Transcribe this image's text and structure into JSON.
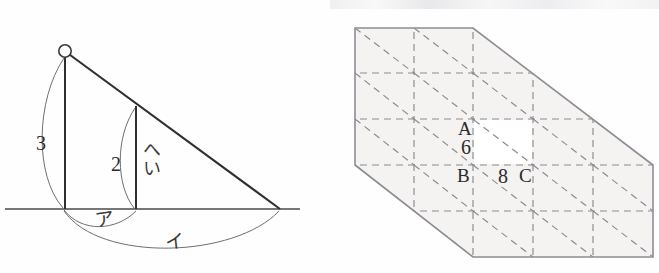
{
  "page": {
    "background_color": "#fefefe",
    "width": 659,
    "height": 273
  },
  "figures": [
    {
      "id": "left-figure",
      "name": "right-triangle-with-similar-inner-triangle",
      "description": "Right triangle standing on a horizontal ground line with a pivot circle at the apex, an inner parallel vertical segment, and two arcs measuring base lengths.",
      "stroke_color": "#3a3a3a",
      "labels": [
        {
          "name": "label-3",
          "text": "3",
          "x": 38,
          "y": 133,
          "kind": "number"
        },
        {
          "name": "label-2",
          "text": "2",
          "x": 113,
          "y": 155,
          "kind": "number"
        },
        {
          "name": "label-hei",
          "text": "へい",
          "x": 139,
          "y": 142,
          "kind": "japanese-vertical"
        },
        {
          "name": "label-a",
          "text": "ア",
          "x": 96,
          "y": 212,
          "kind": "japanese"
        },
        {
          "name": "label-i",
          "text": "イ",
          "x": 166,
          "y": 233,
          "kind": "japanese"
        }
      ],
      "geometry": {
        "apex_circle": {
          "cx": 65,
          "cy": 51,
          "r": 6.5
        },
        "ground_line": {
          "x1": 5,
          "y1": 209,
          "x2": 300,
          "y2": 209
        },
        "left_vertical": {
          "x": 65,
          "y_top": 57,
          "y_bottom": 209,
          "length_label": "3"
        },
        "inner_vertical": {
          "x": 136,
          "y_top": 107,
          "y_bottom": 209,
          "length_label": "2"
        },
        "hypotenuse": {
          "x1": 65,
          "y1": 52,
          "x2": 280,
          "y2": 209
        },
        "arc_3": {
          "from": "apex",
          "to": "left-base",
          "label": "3"
        },
        "arc_2": {
          "from": "inner-top",
          "to": "inner-base",
          "label": "2"
        },
        "arc_a": {
          "from": "left-base",
          "to": "inner-base",
          "label": "ア"
        },
        "arc_i": {
          "from": "left-base",
          "to": "right-base",
          "label": "イ"
        }
      }
    },
    {
      "id": "right-figure",
      "name": "grid-hexagon-prism-net",
      "description": "Shaded hexagonal outline filled with a dashed square grid and dashed diagonals, annotated with points A, B, C and lengths 6 and 8.",
      "outline_color": "#8d8d93",
      "fill_color": "#f5f4f3",
      "grid_color": "#8a8a90",
      "grid": {
        "columns_x": [
          355,
          414,
          473,
          533,
          593,
          653
        ],
        "rows_y": [
          28,
          73,
          119,
          165,
          211,
          257
        ],
        "dashed": true,
        "diagonals": "down-right"
      },
      "outline_points": "355,28 473,28 653,165 653,257 473,257 355,165",
      "labels": [
        {
          "name": "label-A",
          "text": "A",
          "x": 459,
          "y": 121,
          "kind": "letter"
        },
        {
          "name": "label-6",
          "text": "6",
          "x": 462,
          "y": 139,
          "kind": "number"
        },
        {
          "name": "label-B",
          "text": "B",
          "x": 459,
          "y": 168,
          "kind": "letter"
        },
        {
          "name": "label-8",
          "text": "8",
          "x": 500,
          "y": 168,
          "kind": "number"
        },
        {
          "name": "label-C",
          "text": "C",
          "x": 520,
          "y": 168,
          "kind": "letter"
        }
      ]
    }
  ]
}
